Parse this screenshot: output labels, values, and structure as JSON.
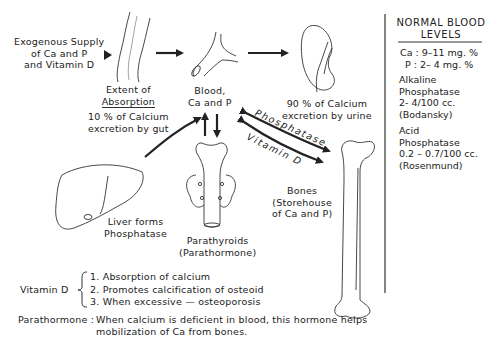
{
  "diagram": {
    "nodes": {
      "exogenous": {
        "line1": "Exogenous Supply",
        "line2": "of Ca and P",
        "line3": "and Vitamin D"
      },
      "intestine": {
        "title": "Extent of",
        "title2": "Absorption",
        "line1": "10 % of Calcium",
        "line2": "excretion by gut"
      },
      "blood": {
        "line1": "Blood,",
        "line2": "Ca and P"
      },
      "kidney": {
        "line1": "90 % of Calcium",
        "line2": "excretion by urine"
      },
      "liver": {
        "line1": "Liver forms",
        "line2": "Phosphatase"
      },
      "parathyroids": {
        "line1": "Parathyroids",
        "line2": "(Parathormone)"
      },
      "bones": {
        "line1": "Bones",
        "line2": "(Storehouse",
        "line3": "of Ca and P)"
      }
    },
    "edge_labels": {
      "phosphatase": "Phosphatase",
      "vitamin_d": "Vitamin D"
    },
    "icons": [
      "intestine-icon",
      "blood-vessel-icon",
      "kidney-icon",
      "liver-icon",
      "parathyroid-icon",
      "femur-bone-icon"
    ]
  },
  "sidebar": {
    "title1": "NORMAL BLOOD",
    "title2": "LEVELS",
    "ca": "Ca : 9–11 mg. %",
    "p": "P : 2– 4  mg. %",
    "alkaline": {
      "l1": "Alkaline",
      "l2": "Phosphatase",
      "l3": "2- 4/100 cc.",
      "l4": "(Bodansky)"
    },
    "acid": {
      "l1": "Acid",
      "l2": "Phosphatase",
      "l3": "0.2 – 0.7/100 cc.",
      "l4": "(Rosenmund)"
    }
  },
  "notes": {
    "vitamin_d_label": "Vitamin D",
    "vitamin_d_items": [
      "1. Absorption of calcium",
      "2. Promotes calcification of osteoid",
      "3. When excessive — osteoporosis"
    ],
    "parathormone_label": "Parathormone :",
    "parathormone_line1": "When calcium is deficient in blood, this hormone helps",
    "parathormone_line2": "mobilization of Ca from bones."
  }
}
